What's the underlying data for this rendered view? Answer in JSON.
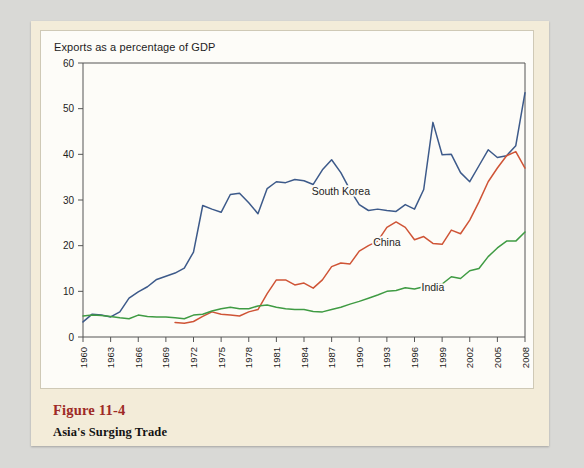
{
  "figure": {
    "number": "Figure 11-4",
    "caption": "Asia's Surging Trade"
  },
  "colors": {
    "south_korea": "#3d5a8a",
    "china": "#cf5436",
    "india": "#3f9b43",
    "axis": "#555555",
    "panel_bg": "#f3ecd9",
    "card_bg": "#fdfcf8",
    "figure_number": "#9e2a26",
    "page_bg": "#d9d9d6"
  },
  "chart_data": {
    "type": "line",
    "title": "Exports as a percentage of GDP",
    "xlabel": "",
    "ylabel": "",
    "ylim": [
      0,
      60
    ],
    "xlim": [
      1960,
      2008
    ],
    "yticks": [
      0,
      10,
      20,
      30,
      40,
      50,
      60
    ],
    "xticks": [
      1960,
      1963,
      1966,
      1969,
      1972,
      1975,
      1978,
      1981,
      1984,
      1987,
      1990,
      1993,
      1996,
      1999,
      2002,
      2005,
      2008
    ],
    "grid": false,
    "legend": "inline-labels",
    "x": [
      1960,
      1961,
      1962,
      1963,
      1964,
      1965,
      1966,
      1967,
      1968,
      1969,
      1970,
      1971,
      1972,
      1973,
      1974,
      1975,
      1976,
      1977,
      1978,
      1979,
      1980,
      1981,
      1982,
      1983,
      1984,
      1985,
      1986,
      1987,
      1988,
      1989,
      1990,
      1991,
      1992,
      1993,
      1994,
      1995,
      1996,
      1997,
      1998,
      1999,
      2000,
      2001,
      2002,
      2003,
      2004,
      2005,
      2006,
      2007,
      2008
    ],
    "series": [
      {
        "name": "South Korea",
        "color": "#3d5a8a",
        "label_x": 1988,
        "label_y": 31,
        "values": [
          3.3,
          5.0,
          4.8,
          4.4,
          5.5,
          8.5,
          9.9,
          11.0,
          12.6,
          13.3,
          14.0,
          15.1,
          18.6,
          28.8,
          28.0,
          27.3,
          31.2,
          31.5,
          29.4,
          27.0,
          32.5,
          34.0,
          33.8,
          34.5,
          34.2,
          33.4,
          36.6,
          38.8,
          36.0,
          32.2,
          29.0,
          27.7,
          28.0,
          27.7,
          27.5,
          29.0,
          28.0,
          32.3,
          47.0,
          39.9,
          40.0,
          36.0,
          34.0,
          37.5,
          41.0,
          39.3,
          39.7,
          41.9,
          53.5
        ]
      },
      {
        "name": "China",
        "color": "#cf5436",
        "label_x": 1993,
        "label_y": 20,
        "values": [
          null,
          null,
          null,
          null,
          null,
          null,
          null,
          null,
          null,
          null,
          3.2,
          3.0,
          3.4,
          4.5,
          5.5,
          5.0,
          4.8,
          4.6,
          5.5,
          6.0,
          9.5,
          12.5,
          12.5,
          11.4,
          11.8,
          10.7,
          12.5,
          15.4,
          16.2,
          16.0,
          18.8,
          20.0,
          21.0,
          24.0,
          25.2,
          24.0,
          21.3,
          22.0,
          20.5,
          20.3,
          23.4,
          22.6,
          25.6,
          29.6,
          34.0,
          37.0,
          39.7,
          40.6,
          37.0
        ]
      },
      {
        "name": "India",
        "color": "#3f9b43",
        "label_x": 1998,
        "label_y": 10,
        "values": [
          4.6,
          4.8,
          4.7,
          4.5,
          4.2,
          4.0,
          4.8,
          4.5,
          4.4,
          4.4,
          4.2,
          4.0,
          4.8,
          5.0,
          5.7,
          6.2,
          6.5,
          6.2,
          6.2,
          6.8,
          7.0,
          6.5,
          6.2,
          6.0,
          6.0,
          5.6,
          5.5,
          6.0,
          6.5,
          7.2,
          7.8,
          8.5,
          9.2,
          10.0,
          10.2,
          10.8,
          10.5,
          11.0,
          11.5,
          11.6,
          13.2,
          12.8,
          14.5,
          15.0,
          17.6,
          19.5,
          21.0,
          21.0,
          23.0
        ]
      }
    ]
  }
}
